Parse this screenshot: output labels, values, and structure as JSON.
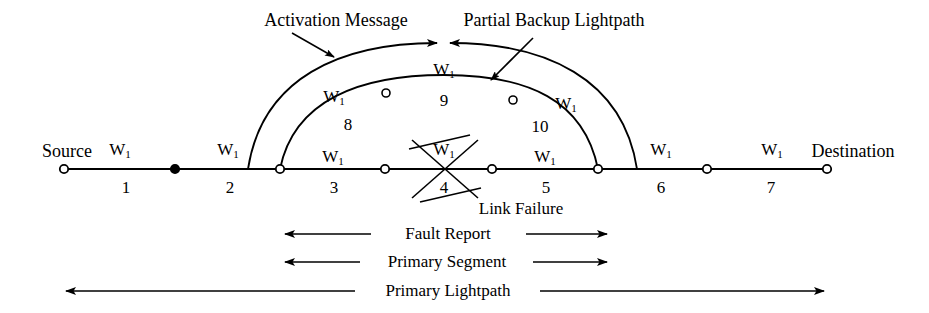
{
  "diagram": {
    "endpoints": {
      "source_label": "Source",
      "destination_label": "Destination"
    },
    "wavelength_label": "W",
    "wavelength_sub": "1",
    "primary_link_numbers": [
      "1",
      "2",
      "3",
      "4",
      "5",
      "6",
      "7"
    ],
    "backup_link_numbers": [
      "8",
      "9",
      "10"
    ],
    "annotations": {
      "activation_message": "Activation Message",
      "partial_backup_lightpath": "Partial Backup Lightpath",
      "link_failure": "Link Failure",
      "fault_report": "Fault Report",
      "primary_segment": "Primary Segment",
      "primary_lightpath": "Primary Lightpath"
    },
    "colors": {
      "line": "#000000",
      "background": "#ffffff",
      "node_fill_hollow": "#ffffff",
      "node_fill_solid": "#000000"
    },
    "primary_nodes": [
      {
        "name": "source",
        "x": 64,
        "type": "hollow"
      },
      {
        "name": "node-a",
        "x": 175,
        "type": "solid"
      },
      {
        "name": "node-b",
        "x": 280,
        "type": "hollow"
      },
      {
        "name": "node-c",
        "x": 385,
        "type": "hollow"
      },
      {
        "name": "node-d",
        "x": 492,
        "type": "hollow"
      },
      {
        "name": "node-e",
        "x": 598,
        "type": "hollow"
      },
      {
        "name": "node-f",
        "x": 707,
        "type": "hollow"
      },
      {
        "name": "destination",
        "x": 827,
        "type": "hollow"
      }
    ],
    "backup_nodes": [
      {
        "name": "backup-node-1",
        "x": 386,
        "y": 93
      },
      {
        "name": "backup-node-2",
        "x": 513,
        "y": 100
      }
    ],
    "w_labels_primary": [
      "W1",
      "W1",
      "W1",
      "W1",
      "W1",
      "W1",
      "W1"
    ],
    "w_labels_backup": [
      "W1",
      "W1",
      "W1"
    ]
  }
}
